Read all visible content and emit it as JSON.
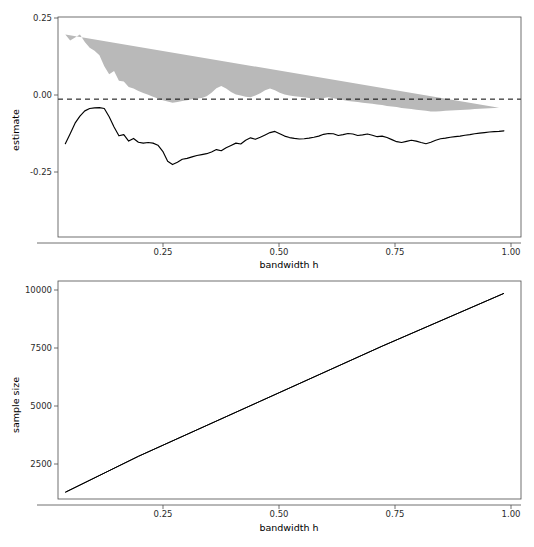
{
  "page": {
    "header_left": "",
    "header_right": "",
    "background": "#ffffff"
  },
  "colors": {
    "band": "#b9b9b9",
    "line": "#000000",
    "axis": "#4d4d4d",
    "text": "#2b2b2b"
  },
  "figures": [
    {
      "name": "estimate-vs-bandwidth",
      "ylabel": "estimate",
      "xlabel": "bandwidth h",
      "ytick_labels": [
        "0.25",
        "0.00",
        "-0.25"
      ],
      "xtick_labels": [
        "0.25",
        "0.50",
        "0.75",
        "1.00"
      ]
    },
    {
      "name": "sample-size-vs-bandwidth",
      "ylabel": "sample size",
      "xlabel": "bandwidth h",
      "ytick_labels": [
        "10000",
        "7500",
        "5000",
        "2500"
      ],
      "xtick_labels": [
        "0.25",
        "0.50",
        "0.75",
        "1.00"
      ]
    }
  ],
  "chart_data": [
    {
      "type": "line",
      "name": "estimate-vs-bandwidth",
      "title": "",
      "xlabel": "bandwidth h",
      "ylabel": "estimate",
      "xlim": [
        0.085,
        1.035
      ],
      "ylim": [
        -0.47,
        0.28
      ],
      "xticks": [
        0.25,
        0.5,
        0.75,
        1.0
      ],
      "yticks": [
        0.25,
        0.0,
        -0.25
      ],
      "grid": false,
      "legend": "none",
      "annotations": [
        {
          "type": "hline",
          "y": 0.0,
          "style": "dashed",
          "label": "zero reference"
        }
      ],
      "x": [
        0.1,
        0.11,
        0.12,
        0.13,
        0.14,
        0.15,
        0.16,
        0.17,
        0.18,
        0.19,
        0.2,
        0.21,
        0.22,
        0.23,
        0.24,
        0.25,
        0.26,
        0.27,
        0.28,
        0.29,
        0.3,
        0.31,
        0.32,
        0.33,
        0.34,
        0.35,
        0.36,
        0.37,
        0.38,
        0.39,
        0.4,
        0.41,
        0.42,
        0.43,
        0.44,
        0.45,
        0.46,
        0.47,
        0.48,
        0.49,
        0.5,
        0.51,
        0.52,
        0.53,
        0.54,
        0.55,
        0.56,
        0.57,
        0.58,
        0.59,
        0.6,
        0.61,
        0.62,
        0.63,
        0.64,
        0.65,
        0.66,
        0.67,
        0.68,
        0.69,
        0.7,
        0.71,
        0.72,
        0.73,
        0.74,
        0.75,
        0.76,
        0.77,
        0.78,
        0.79,
        0.8,
        0.81,
        0.82,
        0.83,
        0.84,
        0.85,
        0.86,
        0.87,
        0.88,
        0.89,
        0.9,
        0.91,
        0.92,
        0.93,
        0.94,
        0.95,
        0.96,
        0.97,
        0.98,
        0.99,
        1.0
      ],
      "series": [
        {
          "name": "estimate",
          "values": [
            -0.152,
            -0.118,
            -0.082,
            -0.058,
            -0.04,
            -0.032,
            -0.03,
            -0.029,
            -0.032,
            -0.06,
            -0.095,
            -0.125,
            -0.121,
            -0.143,
            -0.134,
            -0.147,
            -0.15,
            -0.148,
            -0.15,
            -0.157,
            -0.178,
            -0.212,
            -0.223,
            -0.215,
            -0.205,
            -0.202,
            -0.197,
            -0.192,
            -0.189,
            -0.186,
            -0.18,
            -0.172,
            -0.176,
            -0.166,
            -0.158,
            -0.15,
            -0.153,
            -0.14,
            -0.132,
            -0.137,
            -0.13,
            -0.122,
            -0.114,
            -0.11,
            -0.118,
            -0.126,
            -0.131,
            -0.134,
            -0.136,
            -0.135,
            -0.133,
            -0.13,
            -0.126,
            -0.12,
            -0.117,
            -0.118,
            -0.124,
            -0.121,
            -0.117,
            -0.119,
            -0.124,
            -0.122,
            -0.119,
            -0.123,
            -0.128,
            -0.126,
            -0.131,
            -0.138,
            -0.145,
            -0.148,
            -0.144,
            -0.14,
            -0.143,
            -0.148,
            -0.152,
            -0.147,
            -0.14,
            -0.135,
            -0.133,
            -0.13,
            -0.128,
            -0.126,
            -0.123,
            -0.121,
            -0.118,
            -0.116,
            -0.114,
            -0.112,
            -0.111,
            -0.11,
            -0.108
          ]
        },
        {
          "name": "ci_upper",
          "values": [
            0.22,
            0.2,
            0.21,
            0.22,
            0.195,
            0.175,
            0.165,
            0.15,
            0.112,
            0.085,
            0.096,
            0.063,
            0.06,
            0.041,
            0.036,
            0.028,
            0.021,
            0.015,
            0.008,
            0.002,
            -0.004,
            -0.008,
            -0.012,
            -0.01,
            -0.006,
            -0.004,
            0.0,
            0.002,
            0.004,
            0.01,
            0.022,
            0.037,
            0.045,
            0.036,
            0.024,
            0.016,
            0.012,
            0.008,
            0.006,
            0.012,
            0.02,
            0.03,
            0.036,
            0.03,
            0.022,
            0.016,
            0.012,
            0.01,
            0.008,
            0.006,
            0.004,
            0.002,
            0.0,
            0.004,
            0.006,
            0.003,
            0.0,
            -0.003,
            -0.006,
            -0.008,
            -0.01,
            -0.012,
            -0.014,
            -0.016,
            -0.018,
            -0.02,
            -0.023,
            -0.025,
            -0.027,
            -0.03,
            -0.032,
            -0.034,
            -0.036,
            -0.038,
            -0.04,
            -0.042,
            -0.042,
            -0.041,
            -0.04,
            -0.039,
            -0.038,
            -0.037,
            -0.036,
            -0.035,
            -0.034,
            -0.033,
            -0.032,
            -0.031,
            -0.03,
            -0.029
          ]
        },
        {
          "name": "ci_lower",
          "values": [
            -0.47,
            -0.47,
            -0.43,
            -0.37,
            -0.32,
            -0.31,
            -0.31,
            -0.3,
            -0.31,
            -0.33,
            -0.37,
            -0.37,
            -0.34,
            -0.33,
            -0.33,
            -0.32,
            -0.33,
            -0.35,
            -0.36,
            -0.4,
            -0.42,
            -0.41,
            -0.38,
            -0.36,
            -0.36,
            -0.35,
            -0.345,
            -0.34,
            -0.335,
            -0.33,
            -0.32,
            -0.31,
            -0.31,
            -0.315,
            -0.32,
            -0.315,
            -0.31,
            -0.3,
            -0.295,
            -0.29,
            -0.285,
            -0.275,
            -0.268,
            -0.27,
            -0.275,
            -0.28,
            -0.282,
            -0.28,
            -0.276,
            -0.272,
            -0.268,
            -0.264,
            -0.262,
            -0.258,
            -0.256,
            -0.258,
            -0.262,
            -0.26,
            -0.256,
            -0.258,
            -0.262,
            -0.26,
            -0.257,
            -0.26,
            -0.264,
            -0.262,
            -0.266,
            -0.272,
            -0.278,
            -0.28,
            -0.276,
            -0.272,
            -0.274,
            -0.278,
            -0.281,
            -0.276,
            -0.27,
            -0.265,
            -0.262,
            -0.259,
            -0.256,
            -0.253,
            -0.25,
            -0.247,
            -0.244,
            -0.241,
            -0.238,
            -0.235,
            -0.232,
            -0.23,
            -0.212
          ]
        }
      ]
    },
    {
      "type": "line",
      "name": "sample-size-vs-bandwidth",
      "title": "",
      "xlabel": "bandwidth h",
      "ylabel": "sample size",
      "xlim": [
        0.085,
        1.035
      ],
      "ylim": [
        700,
        10400
      ],
      "xticks": [
        0.25,
        0.5,
        0.75,
        1.0
      ],
      "yticks": [
        2500,
        5000,
        7500,
        10000
      ],
      "grid": false,
      "legend": "none",
      "x": [
        0.1,
        0.25,
        0.5,
        0.75,
        1.0
      ],
      "series": [
        {
          "name": "sample size",
          "values": [
            1000,
            2600,
            5050,
            7500,
            9850
          ]
        }
      ]
    }
  ]
}
